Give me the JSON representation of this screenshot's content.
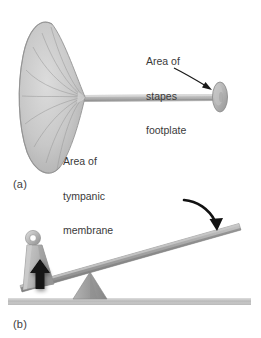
{
  "figure": {
    "width": 261,
    "height": 338,
    "background": "#ffffff"
  },
  "panels": [
    {
      "id": "a",
      "label": "(a)",
      "description": "Cone-shaped tympanic membrane connected by a slender rod to a small elliptical stapes footplate",
      "callouts": [
        {
          "name": "stapes-footplate",
          "text": "Area of\nstapes\nfootplate",
          "lines": [
            "Area of",
            "stapes",
            "footplate"
          ]
        },
        {
          "name": "tympanic-membrane",
          "text": "Area of\ntympanic\nmembrane",
          "lines": [
            "Area of",
            "tympanic",
            "membrane"
          ]
        }
      ]
    },
    {
      "id": "b",
      "label": "(b)",
      "description": "Lever and fulcrum: a weight with a ring hangs at the low left end of an inclined beam resting on a triangular fulcrum; a black arrow points up under the weight and a black curved arrow points down onto the raised right end of the beam",
      "callouts": []
    }
  ],
  "colors": {
    "membrane_fill": "#c3c3c3",
    "membrane_fill_light": "#d8d8d8",
    "membrane_stroke": "#8a8a8a",
    "rod_fill": "#b6b6b6",
    "footplate_fill": "#b0b0b0",
    "beam_fill": "#9a9a9a",
    "beam_highlight": "#c9c9c9",
    "fulcrum_fill": "#9d9d9d",
    "ground_fill": "#bdbdbd",
    "weight_fill": "#b8b8b8",
    "weight_shade": "#8f8f8f",
    "arrow_black": "#111111",
    "text": "#3a3a3a"
  },
  "annotations": {
    "arrow_down_label": "downward force arrow",
    "arrow_up_label": "upward force arrow",
    "leader_label": "curved leader line to footplate"
  }
}
